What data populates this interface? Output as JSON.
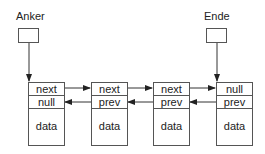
{
  "pointers": {
    "head": {
      "label": "Anker"
    },
    "tail": {
      "label": "Ende"
    }
  },
  "nodes": [
    {
      "next": "next",
      "prev": "null",
      "data": "data"
    },
    {
      "next": "next",
      "prev": "prev",
      "data": "data"
    },
    {
      "next": "next",
      "prev": "prev",
      "data": "data"
    },
    {
      "next": "null",
      "prev": "prev",
      "data": "data"
    }
  ],
  "colors": {
    "line": "#333333",
    "border": "#555555"
  }
}
